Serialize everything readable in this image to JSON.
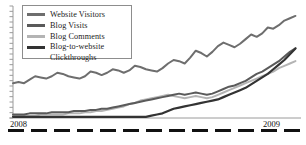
{
  "chart": {
    "type": "line",
    "title": "",
    "background": "#ffffff",
    "axis_color": "#9a9a9a",
    "year_start": "2008",
    "year_end": "2009",
    "legend_position": "top-left",
    "legend_border_color": "#8d8d8d"
  },
  "legend": {
    "items": [
      {
        "label": "Website Visitors",
        "color": "#6e6e6e",
        "wrap": false
      },
      {
        "label": "Blog Visits",
        "color": "#5a5a5a",
        "wrap": false
      },
      {
        "label": "Blog Comments",
        "color": "#b4b4b4",
        "wrap": false
      },
      {
        "label": "Blog-to-website",
        "label2": "Clickthroughs",
        "color": "#333333",
        "wrap": true
      }
    ]
  },
  "chart_data": {
    "type": "line",
    "title": "",
    "xlabel": "",
    "ylabel": "",
    "grid": false,
    "legend_position": "top-left",
    "x_tick_labels": [
      "2008",
      "2009"
    ],
    "x_tick_positions": [
      0,
      0.88
    ],
    "y_ticks_unlabeled": 22,
    "xlim": [
      0,
      52
    ],
    "ylim": [
      0,
      100
    ],
    "x": [
      0,
      1,
      2,
      3,
      4,
      5,
      6,
      7,
      8,
      9,
      10,
      11,
      12,
      13,
      14,
      15,
      16,
      17,
      18,
      19,
      20,
      21,
      22,
      23,
      24,
      25,
      26,
      27,
      28,
      29,
      30,
      31,
      32,
      33,
      34,
      35,
      36,
      37,
      38,
      39,
      40,
      41,
      42,
      43,
      44,
      45,
      46,
      47,
      48,
      49,
      50,
      51
    ],
    "series": [
      {
        "name": "Website Visitors",
        "color": "#6e6e6e",
        "width": 2.0,
        "values": [
          30,
          31,
          30,
          33,
          36,
          35,
          34,
          36,
          39,
          38,
          36,
          35,
          34,
          36,
          40,
          39,
          37,
          39,
          42,
          41,
          39,
          41,
          45,
          44,
          42,
          41,
          40,
          43,
          47,
          50,
          49,
          47,
          52,
          58,
          56,
          53,
          57,
          62,
          65,
          63,
          61,
          64,
          68,
          72,
          70,
          73,
          78,
          77,
          80,
          84,
          86,
          88
        ]
      },
      {
        "name": "Blog Visits",
        "color": "#5a5a5a",
        "width": 2.0,
        "values": [
          3,
          3,
          3,
          4,
          4,
          4,
          4,
          5,
          5,
          5,
          5,
          6,
          6,
          6,
          7,
          7,
          8,
          8,
          9,
          10,
          11,
          12,
          13,
          14,
          15,
          16,
          17,
          18,
          19,
          20,
          21,
          20,
          21,
          22,
          21,
          20,
          21,
          23,
          25,
          27,
          28,
          30,
          32,
          35,
          38,
          40,
          43,
          46,
          49,
          53,
          57,
          60
        ]
      },
      {
        "name": "Blog Comments",
        "color": "#b4b4b4",
        "width": 2.0,
        "values": [
          2,
          2,
          2,
          2,
          2,
          3,
          3,
          3,
          3,
          3,
          4,
          4,
          4,
          5,
          5,
          6,
          6,
          7,
          8,
          9,
          10,
          12,
          13,
          15,
          16,
          17,
          18,
          19,
          20,
          19,
          18,
          17,
          18,
          19,
          18,
          17,
          18,
          20,
          22,
          24,
          26,
          28,
          30,
          32,
          34,
          36,
          38,
          40,
          43,
          45,
          47,
          49
        ]
      },
      {
        "name": "Blog-to-website Clickthroughs",
        "color": "#333333",
        "width": 2.2,
        "values": [
          1,
          1,
          1,
          1,
          1,
          1,
          1,
          1,
          1,
          1,
          1,
          1,
          1,
          1,
          1,
          1,
          1,
          1,
          1,
          1,
          1,
          1,
          1,
          1,
          1,
          2,
          3,
          4,
          6,
          8,
          9,
          10,
          11,
          12,
          13,
          14,
          15,
          16,
          18,
          20,
          22,
          24,
          26,
          29,
          32,
          35,
          38,
          42,
          46,
          50,
          55,
          60
        ]
      }
    ]
  }
}
